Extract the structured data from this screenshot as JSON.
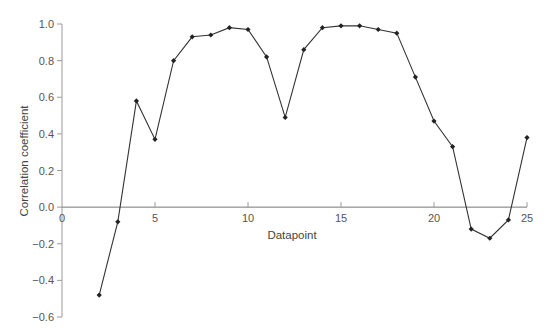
{
  "chart_data": {
    "type": "line",
    "title": "",
    "xlabel": "Datapoint",
    "ylabel": "Correlation coefficient",
    "xlim": [
      0,
      25
    ],
    "ylim": [
      -0.6,
      1.0
    ],
    "x_ticks": [
      0,
      5,
      10,
      15,
      20,
      25
    ],
    "x_tick_labels": [
      "0",
      "5",
      "10",
      "15",
      "20",
      "25"
    ],
    "y_ticks": [
      1.0,
      0.8,
      0.6,
      0.4,
      0.2,
      0.0,
      -0.2,
      -0.4,
      -0.6
    ],
    "y_tick_labels": [
      "1.0",
      "0.8",
      "0.6",
      "0.4",
      "0.2",
      "0.0",
      "−0.2",
      "−0.4",
      "−0.6"
    ],
    "grid": false,
    "legend": null,
    "series": [
      {
        "name": "Correlation coefficient",
        "marker": "diamond",
        "color": "#333333",
        "x": [
          2,
          3,
          4,
          5,
          6,
          7,
          8,
          9,
          10,
          11,
          12,
          13,
          14,
          15,
          16,
          17,
          18,
          19,
          20,
          21,
          22,
          23,
          24,
          25
        ],
        "values": [
          -0.48,
          -0.08,
          0.58,
          0.37,
          0.8,
          0.93,
          0.94,
          0.98,
          0.97,
          0.82,
          0.49,
          0.86,
          0.98,
          0.99,
          0.99,
          0.97,
          0.95,
          0.71,
          0.47,
          0.33,
          -0.12,
          -0.17,
          -0.07,
          0.38
        ]
      }
    ]
  },
  "layout": {
    "plot_left": 62,
    "plot_right": 527,
    "y_top_px": 24,
    "y_bottom_px": 317
  },
  "colors": {
    "axis": "#9a9a9a",
    "line": "#333333",
    "marker": "#222222",
    "text": "#555555"
  }
}
